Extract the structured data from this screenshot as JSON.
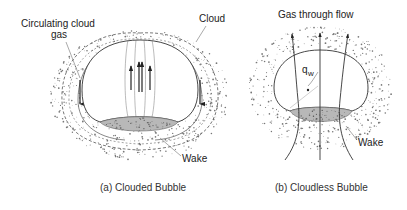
{
  "figure_a": {
    "caption": "(a) Clouded Bubble",
    "labels": {
      "circulating_line1": "Circulating cloud",
      "circulating_line2": "gas",
      "cloud": "Cloud",
      "wake": "Wake"
    }
  },
  "figure_b": {
    "caption": "(b) Cloudless Bubble",
    "labels": {
      "through_flow": "Gas through flow",
      "q": "q",
      "q_sub": "w",
      "wake": "Wake"
    }
  },
  "colors": {
    "line": "#444444",
    "arrow": "#222222",
    "dots": "#777777",
    "wake_fill": "#b8b8b8"
  }
}
